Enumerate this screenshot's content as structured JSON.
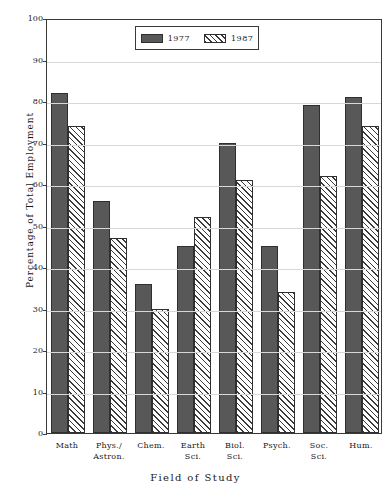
{
  "figure": {
    "clipped_title": "",
    "x_axis_title": "Field of Study",
    "y_axis_title": "Percentage of Total Employment"
  },
  "legend": {
    "entries": [
      {
        "label": "1977",
        "pattern": "solid",
        "color": "#585858"
      },
      {
        "label": "1987",
        "pattern": "hatched",
        "color": "#ffffff"
      }
    ]
  },
  "chart_data": {
    "type": "bar",
    "title": "",
    "xlabel": "Field of Study",
    "ylabel": "Percentage of Total Employment",
    "ylim": [
      0,
      100
    ],
    "yticks": [
      0,
      10,
      20,
      30,
      40,
      50,
      60,
      70,
      80,
      90,
      100
    ],
    "ytick_labels": [
      "0",
      "10",
      "20",
      "30",
      "40",
      "50",
      "60",
      "70",
      "80",
      "90",
      "100"
    ],
    "grid": true,
    "legend_position": "upper center",
    "categories": [
      "Math",
      "Phys./\nAstron.",
      "Chem.",
      "Earth\nSci.",
      "Biol.\nSci.",
      "Psych.",
      "Soc.\nSci.",
      "Hum."
    ],
    "series": [
      {
        "name": "1977",
        "values": [
          82,
          56,
          36,
          45,
          70,
          45,
          79,
          81
        ]
      },
      {
        "name": "1987",
        "values": [
          74,
          47,
          30,
          52,
          61,
          34,
          62,
          74
        ]
      }
    ]
  }
}
